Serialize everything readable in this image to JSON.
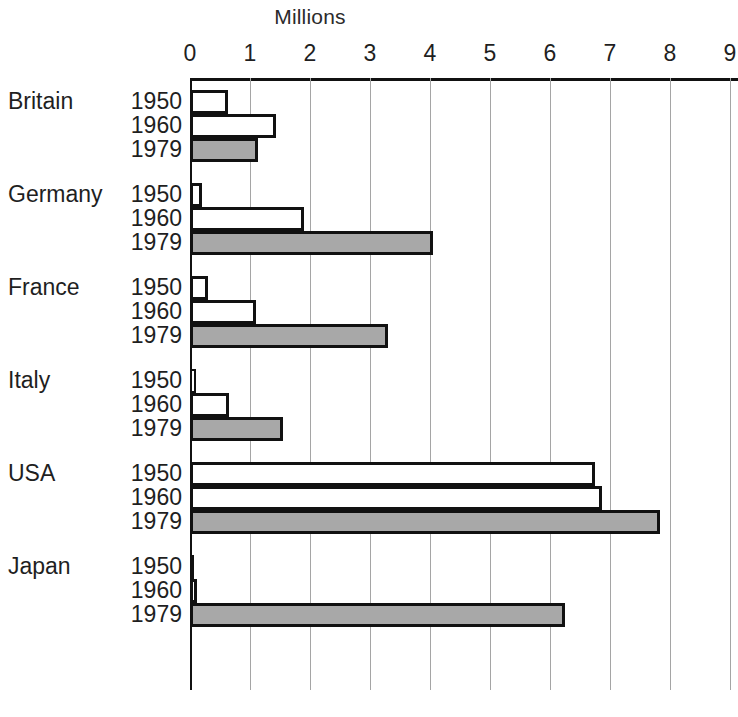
{
  "chart_data": {
    "type": "bar",
    "orientation": "horizontal",
    "title": "Millions",
    "xlabel": "",
    "ylabel": "",
    "xlim": [
      0,
      9
    ],
    "xticks": [
      0,
      1,
      2,
      3,
      4,
      5,
      6,
      7,
      8,
      9
    ],
    "xtick_labels": [
      "0",
      "1",
      "2",
      "3",
      "4",
      "5",
      "6",
      "7",
      "8",
      "9"
    ],
    "grid": true,
    "legend": "none",
    "categories": [
      "Britain",
      "Germany",
      "France",
      "Italy",
      "USA",
      "Japan"
    ],
    "series": [
      {
        "name": "1950",
        "values": [
          0.63,
          0.2,
          0.3,
          0.1,
          6.75,
          0.02
        ]
      },
      {
        "name": "1960",
        "values": [
          1.43,
          1.9,
          1.1,
          0.65,
          6.87,
          0.12
        ]
      },
      {
        "name": "1979",
        "values": [
          1.13,
          4.05,
          3.3,
          1.55,
          7.83,
          6.25
        ]
      }
    ],
    "groups": [
      {
        "country": "Britain",
        "rows": [
          {
            "year": "1950",
            "value": 0.63,
            "style": "outline"
          },
          {
            "year": "1960",
            "value": 1.43,
            "style": "outline"
          },
          {
            "year": "1979",
            "value": 1.13,
            "style": "filled"
          }
        ]
      },
      {
        "country": "Germany",
        "rows": [
          {
            "year": "1950",
            "value": 0.2,
            "style": "outline"
          },
          {
            "year": "1960",
            "value": 1.9,
            "style": "outline"
          },
          {
            "year": "1979",
            "value": 4.05,
            "style": "filled"
          }
        ]
      },
      {
        "country": "France",
        "rows": [
          {
            "year": "1950",
            "value": 0.3,
            "style": "outline"
          },
          {
            "year": "1960",
            "value": 1.1,
            "style": "outline"
          },
          {
            "year": "1979",
            "value": 3.3,
            "style": "filled"
          }
        ]
      },
      {
        "country": "Italy",
        "rows": [
          {
            "year": "1950",
            "value": 0.1,
            "style": "outline"
          },
          {
            "year": "1960",
            "value": 0.65,
            "style": "outline"
          },
          {
            "year": "1979",
            "value": 1.55,
            "style": "filled"
          }
        ]
      },
      {
        "country": "USA",
        "rows": [
          {
            "year": "1950",
            "value": 6.75,
            "style": "outline"
          },
          {
            "year": "1960",
            "value": 6.87,
            "style": "outline"
          },
          {
            "year": "1979",
            "value": 7.83,
            "style": "filled"
          }
        ]
      },
      {
        "country": "Japan",
        "rows": [
          {
            "year": "1950",
            "value": 0.02,
            "style": "outline"
          },
          {
            "year": "1960",
            "value": 0.12,
            "style": "outline"
          },
          {
            "year": "1979",
            "value": 6.25,
            "style": "filled"
          }
        ]
      }
    ],
    "colors": {
      "bar_fill_recent": "#a8a8a8",
      "bar_fill_older": "#ffffff",
      "bar_stroke": "#111111",
      "gridline": "#a5a5a5",
      "axis": "#111111",
      "text": "#1f1f1f",
      "background": "#ffffff"
    }
  },
  "layout": {
    "plot_left_px": 190,
    "plot_top_px": 78,
    "px_per_unit": 60,
    "bar_height_px": 24,
    "group_gap_px": 21
  }
}
